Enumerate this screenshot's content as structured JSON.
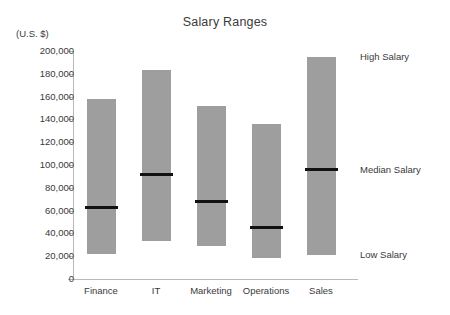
{
  "chart_data": {
    "type": "bar",
    "title": "Salary Ranges",
    "subtitle": "",
    "unit_label": "(U.S. $)",
    "xlabel": "",
    "ylabel": "",
    "ylim": [
      0,
      200000
    ],
    "grid": false,
    "legend_position": "right-inline-annotations",
    "categories": [
      "Finance",
      "IT",
      "Marketing",
      "Operations",
      "Sales"
    ],
    "ytick_labels": [
      "200,000",
      "180,000",
      "160,000",
      "140,000",
      "120,000",
      "100,000",
      "80,000",
      "60,000",
      "40,000",
      "20,000",
      "0"
    ],
    "ytick_values": [
      200000,
      180000,
      160000,
      140000,
      120000,
      100000,
      80000,
      60000,
      40000,
      20000,
      0
    ],
    "series": [
      {
        "name": "Low Salary",
        "values": [
          22000,
          33000,
          29000,
          18000,
          21000
        ]
      },
      {
        "name": "Median Salary",
        "values": [
          63000,
          92000,
          68000,
          45000,
          96000
        ]
      },
      {
        "name": "High Salary",
        "values": [
          158000,
          183000,
          152000,
          136000,
          195000
        ]
      }
    ],
    "bars": [
      {
        "category": "Finance",
        "low": 22000,
        "median": 63000,
        "high": 158000
      },
      {
        "category": "IT",
        "low": 33000,
        "median": 92000,
        "high": 183000
      },
      {
        "category": "Marketing",
        "low": 29000,
        "median": 68000,
        "high": 152000
      },
      {
        "category": "Operations",
        "low": 18000,
        "median": 45000,
        "high": 136000
      },
      {
        "category": "Sales",
        "low": 21000,
        "median": 96000,
        "high": 195000
      }
    ],
    "annotations": [
      {
        "label": "High Salary",
        "value": 195000
      },
      {
        "label": "Median Salary",
        "value": 96000
      },
      {
        "label": "Low Salary",
        "value": 21000
      }
    ],
    "colors": {
      "bar_fill": "#9e9e9e",
      "median_line": "#111111",
      "axis": "#b9b9b9",
      "text": "#3a3a3a",
      "background": "#ffffff"
    }
  }
}
